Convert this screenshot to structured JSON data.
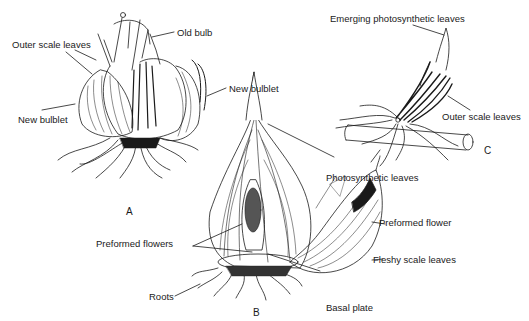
{
  "figure": {
    "panels": [
      {
        "id": "A",
        "letter": "A",
        "labels": {
          "old_bulb": "Old bulb",
          "outer_scale_leaves": "Outer scale leaves",
          "new_bulblet_left": "New bulblet",
          "new_bulblet_right": "New bulblet"
        }
      },
      {
        "id": "B",
        "letter": "B",
        "labels": {
          "photosynthetic_leaves": "Photosynthetic leaves",
          "preformed_flowers": "Preformed flowers",
          "preformed_flower": "Preformed flower",
          "fleshy_scale_leaves": "Fleshy scale leaves",
          "roots": "Roots",
          "basal_plate": "Basal plate"
        }
      },
      {
        "id": "C",
        "letter": "C",
        "labels": {
          "emerging_photosynthetic_leaves": "Emerging photosynthetic leaves",
          "outer_scale_leaves": "Outer scale leaves"
        }
      }
    ],
    "colors": {
      "ink": "#1a1a1a",
      "background": "#ffffff"
    }
  }
}
